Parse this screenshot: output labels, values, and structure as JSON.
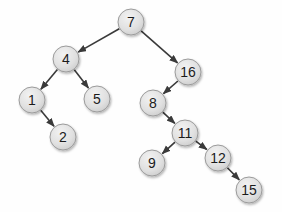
{
  "diagram": {
    "type": "binary-tree",
    "background": "#fefefe",
    "node_style": {
      "radius": 13,
      "fill_light": "#f2f2f2",
      "fill_mid": "#e0e0e0",
      "fill_dark": "#c8c8c8",
      "border_color": "#9b9b9b",
      "text_color": "#1b1b1b",
      "font_size": 14
    },
    "edge_style": {
      "color": "#3a3a3a",
      "width": 1.6
    },
    "nodes": [
      {
        "id": "7",
        "label": "7",
        "x": 131,
        "y": 22
      },
      {
        "id": "4",
        "label": "4",
        "x": 66,
        "y": 59
      },
      {
        "id": "16",
        "label": "16",
        "x": 188,
        "y": 72
      },
      {
        "id": "1",
        "label": "1",
        "x": 32,
        "y": 100
      },
      {
        "id": "5",
        "label": "5",
        "x": 97,
        "y": 99
      },
      {
        "id": "8",
        "label": "8",
        "x": 153,
        "y": 103
      },
      {
        "id": "2",
        "label": "2",
        "x": 63,
        "y": 137
      },
      {
        "id": "11",
        "label": "11",
        "x": 185,
        "y": 133
      },
      {
        "id": "9",
        "label": "9",
        "x": 152,
        "y": 163
      },
      {
        "id": "12",
        "label": "12",
        "x": 218,
        "y": 158
      },
      {
        "id": "15",
        "label": "15",
        "x": 249,
        "y": 190
      }
    ],
    "edges": [
      {
        "from": "7",
        "to": "4"
      },
      {
        "from": "7",
        "to": "16"
      },
      {
        "from": "4",
        "to": "1"
      },
      {
        "from": "4",
        "to": "5"
      },
      {
        "from": "1",
        "to": "2"
      },
      {
        "from": "16",
        "to": "8"
      },
      {
        "from": "8",
        "to": "11"
      },
      {
        "from": "11",
        "to": "9"
      },
      {
        "from": "11",
        "to": "12"
      },
      {
        "from": "12",
        "to": "15"
      }
    ]
  }
}
